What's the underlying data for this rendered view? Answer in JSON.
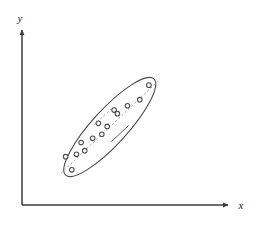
{
  "figure": {
    "title": "",
    "background_color": "#ffffff",
    "width": 258,
    "height": 229,
    "axis_color": "#3b3b3b",
    "ellipse_color": "#4a4a4a",
    "point_color": "#4a4a4a",
    "dashed_color": "#8a8a8a"
  },
  "axes": {
    "x_label": "x",
    "y_label": "y",
    "origin_x": 22,
    "origin_y": 205,
    "x_end": 233,
    "y_end": 27,
    "arrowheads": true,
    "ticks": false,
    "tick_labels": []
  },
  "chart_data": {
    "type": "scatter",
    "title": "",
    "xlabel": "x",
    "ylabel": "y",
    "grid": false,
    "legend": null,
    "axis_ticks_shown": false,
    "xlim": [
      0,
      100
    ],
    "ylim": [
      0,
      100
    ],
    "series": [
      {
        "name": "observations",
        "marker": "open-circle",
        "marker_size": 4.6,
        "points": [
          {
            "x": 21.2,
            "y": 14.4
          },
          {
            "x": 17.1,
            "y": 23.8
          },
          {
            "x": 24.3,
            "y": 25.5
          },
          {
            "x": 29.8,
            "y": 28.1
          },
          {
            "x": 27.4,
            "y": 33.9
          },
          {
            "x": 35.1,
            "y": 36.9
          },
          {
            "x": 41.2,
            "y": 39.8
          },
          {
            "x": 38.9,
            "y": 47.6
          },
          {
            "x": 44.8,
            "y": 45.4
          },
          {
            "x": 49.4,
            "y": 57.1
          },
          {
            "x": 51.6,
            "y": 54.5
          },
          {
            "x": 58.3,
            "y": 60.2
          },
          {
            "x": 66.5,
            "y": 64.5
          },
          {
            "x": 72.6,
            "y": 74.9
          }
        ]
      }
    ],
    "annotations": [
      {
        "kind": "ellipse",
        "label": "concentration-ellipse",
        "center_x": 46.5,
        "center_y": 45.0,
        "semi_major": 43.5,
        "semi_minor": 12.5,
        "rotation_deg": -47.5,
        "style": "solid"
      },
      {
        "kind": "line",
        "label": "major-axis",
        "style": "dashed",
        "x1": 14.0,
        "y1": 12.0,
        "x2": 79.0,
        "y2": 78.0
      },
      {
        "kind": "line",
        "label": "minor-axis-tick-upper",
        "style": "dashed",
        "x1": 36.0,
        "y1": 46.5,
        "x2": 47.5,
        "y2": 58.0
      },
      {
        "kind": "line",
        "label": "minor-axis-tick-lower",
        "style": "solid",
        "x1": 47.5,
        "y1": 34.5,
        "x2": 59.0,
        "y2": 46.0
      }
    ]
  }
}
